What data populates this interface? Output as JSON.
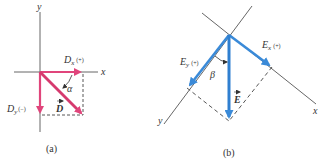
{
  "colors": {
    "panel_a_vector": "#e0457b",
    "panel_b_vector": "#3a8ad8",
    "axis": "#555555",
    "dashed": "#444444"
  },
  "panel_a": {
    "caption": "(a)",
    "y_axis_label": "y",
    "x_axis_label": "x",
    "dx_label": "D",
    "dx_sub": "x",
    "dx_sign": "(+)",
    "dy_label": "D",
    "dy_sub": "y",
    "dy_sign": "(−)",
    "vector_label": "D",
    "angle_label": "α"
  },
  "panel_b": {
    "caption": "(b)",
    "y_axis_label": "y",
    "x_axis_label": "x",
    "ex_label": "E",
    "ex_sub": "x",
    "ex_sign": "(+)",
    "ey_label": "E",
    "ey_sub": "y",
    "ey_sign": "(+)",
    "vector_label": "E",
    "angle_label": "β"
  }
}
